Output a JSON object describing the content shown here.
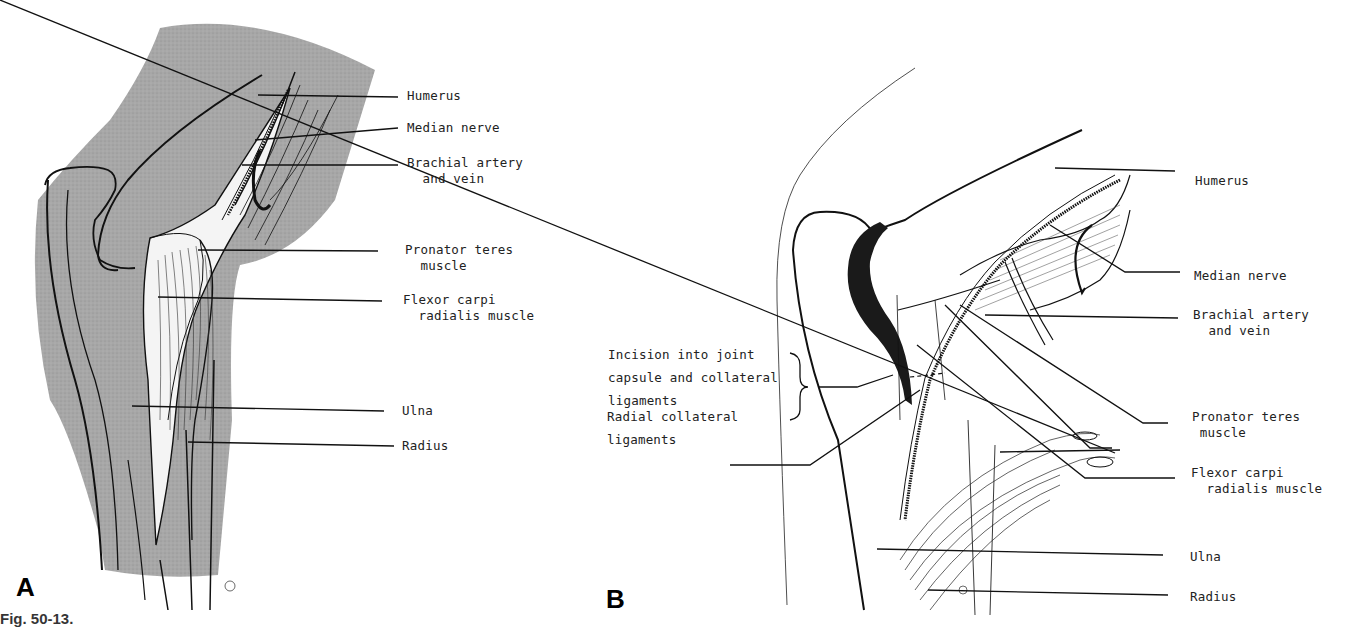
{
  "figure": {
    "caption_fragment": "Fig. 50-13.",
    "panels": [
      {
        "letter": "A",
        "labels": {
          "humerus": "Humerus",
          "median_nerve": "Median nerve",
          "brachial_artery_vein": "Brachial artery\n  and vein",
          "pronator_teres": "Pronator teres\n  muscle",
          "flexor_carpi_radialis": "Flexor carpi\n  radialis muscle",
          "ulna": "Ulna",
          "radius": "Radius"
        }
      },
      {
        "letter": "B",
        "labels": {
          "humerus": "Humerus",
          "median_nerve": "Median nerve",
          "brachial_artery_vein": "Brachial artery\n  and vein",
          "incision": "Incision into joint\ncapsule and collateral\nligaments",
          "radial_collateral": "Radial collateral\nligaments",
          "pronator_teres": "Pronator teres\n muscle",
          "flexor_carpi_radialis": "Flexor carpi\n  radialis muscle",
          "ulna": "Ulna",
          "radius": "Radius"
        }
      }
    ],
    "colors": {
      "shaded_tissue": "#a9a9a9",
      "ink": "#111111",
      "paper": "#ffffff"
    }
  }
}
